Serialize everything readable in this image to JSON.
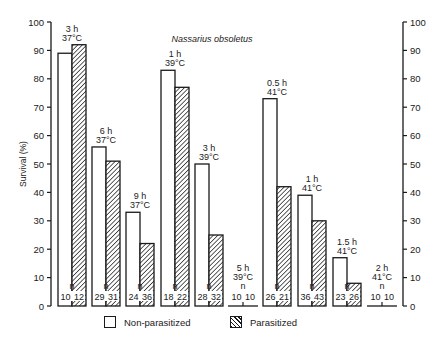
{
  "chart_data": {
    "type": "bar",
    "title": "Nassarius obsoletus",
    "ylabel": "Survival (%)",
    "xlabel": "",
    "ylim": [
      0,
      100
    ],
    "yticks": [
      0,
      10,
      20,
      30,
      40,
      50,
      60,
      70,
      80,
      90,
      100
    ],
    "right_axis": true,
    "grid": false,
    "legend_position": "bottom",
    "categories": [
      "3 h 37°C",
      "6 h 37°C",
      "9 h 37°C",
      "1 h 39°C",
      "3 h 39°C",
      "5 h 39°C",
      "0.5 h 41°C",
      "1 h 41°C",
      "1.5 h 41°C",
      "2 h 41°C"
    ],
    "series": [
      {
        "name": "Non-parasitized",
        "fill": "white",
        "values": [
          89,
          56,
          33,
          83,
          50,
          0,
          73,
          39,
          17,
          0
        ],
        "n": [
          10,
          29,
          24,
          18,
          28,
          10,
          26,
          36,
          23,
          10
        ]
      },
      {
        "name": "Parasitized",
        "fill": "hatched",
        "values": [
          92,
          51,
          22,
          77,
          25,
          0,
          42,
          30,
          8,
          0
        ],
        "n": [
          12,
          31,
          36,
          22,
          32,
          10,
          21,
          43,
          26,
          10
        ]
      }
    ],
    "group_labels": [
      {
        "time": "3 h",
        "temp": "37°C"
      },
      {
        "time": "6 h",
        "temp": "37°C"
      },
      {
        "time": "9 h",
        "temp": "37°C"
      },
      {
        "time": "1 h",
        "temp": "39°C"
      },
      {
        "time": "3 h",
        "temp": "39°C"
      },
      {
        "time": "5 h",
        "temp": "39°C"
      },
      {
        "time": "0.5 h",
        "temp": "41°C"
      },
      {
        "time": "1 h",
        "temp": "41°C"
      },
      {
        "time": "1.5 h",
        "temp": "41°C"
      },
      {
        "time": "2 h",
        "temp": "41°C"
      }
    ],
    "n_marker": "n"
  },
  "legend": {
    "items": [
      {
        "label": "Non-parasitized"
      },
      {
        "label": "Parasitized"
      }
    ]
  }
}
